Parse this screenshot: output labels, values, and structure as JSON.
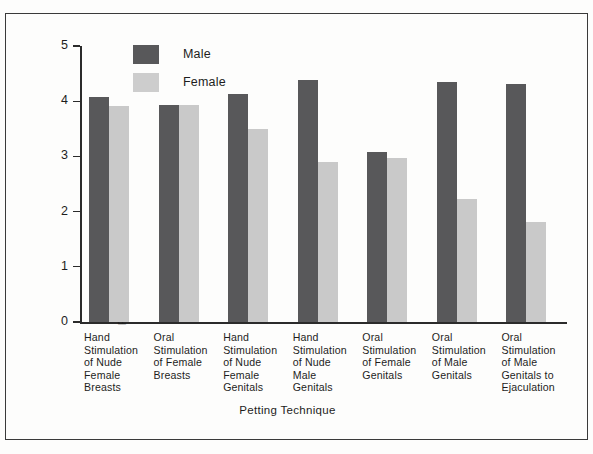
{
  "chart_data": {
    "type": "bar",
    "title": "",
    "xlabel": "Petting Technique",
    "ylabel": "Reported Sexual Arousal and Enjoyment",
    "ylim": [
      0,
      5
    ],
    "yticks": [
      "0",
      "1",
      "2",
      "3",
      "4",
      "5"
    ],
    "grid": false,
    "legend_position": "top-center-inside",
    "categories": [
      "Hand Stimulation of Nude Female Breasts",
      "Oral Stimulation of Female Breasts",
      "Hand Stimulation of Nude Female Genitals",
      "Hand Stimulation of Nude Male Genitals",
      "Oral Stimulation of Female Genitals",
      "Oral Stimulation of Male Genitals",
      "Oral Stimulation of Male Genitals to Ejaculation"
    ],
    "category_lines": [
      [
        "Hand",
        "Stimulation",
        "of Nude",
        "Female",
        "Breasts"
      ],
      [
        "Oral",
        "Stimulation",
        "of Female",
        "Breasts"
      ],
      [
        "Hand",
        "Stimulation",
        "of Nude",
        "Female",
        "Genitals"
      ],
      [
        "Hand",
        "Stimulation",
        "of Nude",
        "Male",
        "Genitals"
      ],
      [
        "Oral",
        "Stimulation",
        "of Female",
        "Genitals"
      ],
      [
        "Oral",
        "Stimulation",
        "of Male",
        "Genitals"
      ],
      [
        "Oral",
        "Stimulation",
        "of Male",
        "Genitals to",
        "Ejaculation"
      ]
    ],
    "series": [
      {
        "name": "Male",
        "color": "#58585a",
        "values": [
          4.08,
          3.93,
          4.13,
          4.38,
          3.08,
          4.35,
          4.32
        ]
      },
      {
        "name": "Female",
        "color": "#c9c9c9",
        "values": [
          3.92,
          3.93,
          3.5,
          2.89,
          2.97,
          2.23,
          1.82
        ]
      }
    ]
  },
  "legend": {
    "items": [
      {
        "label": "Male",
        "swatch": "male"
      },
      {
        "label": "Female",
        "swatch": "female"
      }
    ]
  }
}
